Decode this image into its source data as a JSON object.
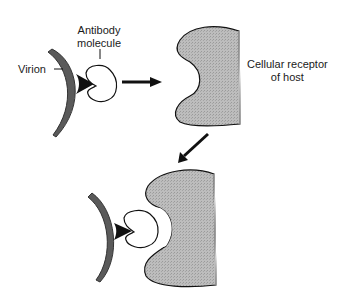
{
  "diagram": {
    "labels": {
      "antibody_line1": "Antibody",
      "antibody_line2": "molecule",
      "virion": "Virion",
      "receptor_line1": "Cellular receptor",
      "receptor_line2": "of host"
    },
    "colors": {
      "receptor_fill": "#b8b8b8",
      "virion_fill": "#5a5a5a",
      "outline": "#111111",
      "background": "#ffffff"
    }
  }
}
